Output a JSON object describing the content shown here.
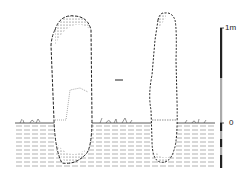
{
  "figure": {
    "scale_bar": {
      "top_label": "1m",
      "ground_label": "0"
    },
    "colors": {
      "ink": "#222222",
      "scale_light": "#aaaaaa",
      "background": "#ffffff"
    }
  }
}
